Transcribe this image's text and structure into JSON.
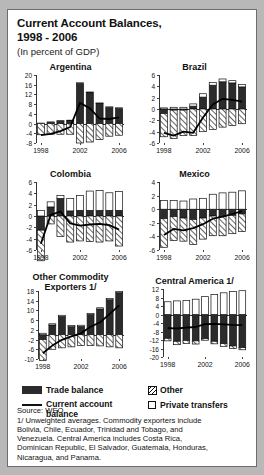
{
  "figure": {
    "title_line1": "Current Account Balances,",
    "title_line2": "1998 - 2006",
    "subtitle": "(In percent of GDP)"
  },
  "legend": {
    "trade_balance": "Trade balance",
    "current_account_line1": "Current account",
    "current_account_line2": "balance",
    "other": "Other",
    "private_transfers": "Private transfers"
  },
  "source": {
    "line1": "Source: WEO.",
    "line2": "1/ Unweighted averages. Commodity exporters include",
    "line3": "Bolivia, Chile, Ecuador, Trinidad and Tobago, and",
    "line4": "Venezuela. Central America includes Costa Rica,",
    "line5": "Dominican Republic, El Salvador, Guatemala, Honduras,",
    "line6": "Nicaragua, and Panama."
  },
  "chart_data": [
    {
      "type": "bar",
      "id": "argentina",
      "title": "Argentina",
      "xlabel": "",
      "ylabel": "",
      "ylim": [
        -8,
        20
      ],
      "yticks": [
        20,
        16,
        12,
        8,
        4,
        0,
        -4,
        -8
      ],
      "categories": [
        "1998",
        "1999",
        "2000",
        "2001",
        "2002",
        "2003",
        "2004",
        "2005",
        "2006"
      ],
      "xticklabels": [
        "1998",
        "",
        "",
        "",
        "2002",
        "",
        "",
        "",
        "2006"
      ],
      "grid": false,
      "legend_position": "figure-bottom",
      "series": [
        {
          "name": "Trade balance",
          "stack": "pos",
          "values": [
            0.0,
            0.5,
            1.0,
            1.2,
            16.5,
            12.7,
            8.2,
            6.6,
            6.2
          ]
        },
        {
          "name": "Other",
          "stack": "neg",
          "values": [
            -4.6,
            -4.4,
            -4.4,
            -4.4,
            -8.0,
            -7.6,
            -6.6,
            -5.2,
            -4.8
          ]
        },
        {
          "name": "Private transfers",
          "stack": "pos-small",
          "values": [
            0.2,
            0.2,
            0.2,
            0.2,
            0.3,
            0.3,
            0.3,
            0.3,
            0.3
          ]
        },
        {
          "name": "Current account balance",
          "type": "line",
          "values": [
            -4.8,
            -4.2,
            -3.1,
            -1.4,
            8.5,
            6.3,
            2.1,
            1.9,
            2.6
          ]
        }
      ]
    },
    {
      "type": "bar",
      "id": "brazil",
      "title": "Brazil",
      "xlabel": "",
      "ylabel": "",
      "ylim": [
        -6,
        6
      ],
      "yticks": [
        6,
        4,
        2,
        0,
        -2,
        -4,
        -6
      ],
      "categories": [
        "1998",
        "1999",
        "2000",
        "2001",
        "2002",
        "2003",
        "2004",
        "2005",
        "2006"
      ],
      "xticklabels": [
        "1998",
        "",
        "",
        "",
        "2002",
        "",
        "",
        "",
        "2006"
      ],
      "grid": false,
      "series": [
        {
          "name": "Trade balance",
          "stack": "pos",
          "values": [
            -0.8,
            -0.2,
            -0.2,
            0.5,
            2.1,
            4.2,
            4.8,
            4.6,
            3.9
          ]
        },
        {
          "name": "Other",
          "stack": "neg",
          "values": [
            -4.1,
            -5.0,
            -4.5,
            -4.7,
            -4.0,
            -3.6,
            -3.2,
            -2.9,
            -2.6
          ]
        },
        {
          "name": "Private transfers",
          "stack": "pos-small",
          "values": [
            0.2,
            0.3,
            0.3,
            0.4,
            0.6,
            0.5,
            0.5,
            0.4,
            0.4
          ]
        },
        {
          "name": "Current account balance",
          "type": "line",
          "values": [
            -4.2,
            -4.7,
            -4.0,
            -4.2,
            -1.5,
            0.8,
            1.8,
            1.6,
            1.3
          ]
        }
      ]
    },
    {
      "type": "bar",
      "id": "colombia",
      "title": "Colombia",
      "xlabel": "",
      "ylabel": "",
      "ylim": [
        -6,
        6
      ],
      "yticks": [
        6,
        4,
        2,
        0,
        -2,
        -4,
        -6
      ],
      "categories": [
        "1998",
        "1999",
        "2000",
        "2001",
        "2002",
        "2003",
        "2004",
        "2005",
        "2006"
      ],
      "xticklabels": [
        "1998",
        "",
        "",
        "",
        "2002",
        "",
        "",
        "",
        "2006"
      ],
      "grid": false,
      "series": [
        {
          "name": "Trade balance",
          "stack": "pos-neg",
          "values": [
            -2.5,
            1.6,
            3.1,
            0.9,
            1.0,
            1.0,
            1.0,
            1.0,
            1.0
          ]
        },
        {
          "name": "Other",
          "stack": "neg",
          "values": [
            -5.4,
            -1.4,
            -3.6,
            -4.6,
            -4.4,
            -4.5,
            -4.6,
            -4.4,
            -5.3
          ]
        },
        {
          "name": "Private transfers",
          "stack": "pos",
          "values": [
            1.0,
            0.9,
            0.5,
            2.2,
            2.6,
            3.4,
            3.5,
            3.1,
            3.3
          ]
        },
        {
          "name": "Current account balance",
          "type": "line",
          "values": [
            -4.9,
            0.2,
            0.8,
            -1.3,
            -1.7,
            -1.5,
            -1.4,
            -1.6,
            -2.4
          ]
        }
      ]
    },
    {
      "type": "bar",
      "id": "mexico",
      "title": "Mexico",
      "xlabel": "",
      "ylabel": "",
      "ylim": [
        -6,
        4
      ],
      "yticks": [
        4,
        2,
        0,
        -2,
        -4,
        -6
      ],
      "categories": [
        "1998",
        "1999",
        "2000",
        "2001",
        "2002",
        "2003",
        "2004",
        "2005",
        "2006"
      ],
      "xticklabels": [
        "1998",
        "",
        "",
        "",
        "2002",
        "",
        "",
        "",
        "2006"
      ],
      "grid": false,
      "series": [
        {
          "name": "Trade balance",
          "stack": "neg",
          "values": [
            -1.4,
            -1.1,
            -1.3,
            -1.5,
            -1.3,
            -1.0,
            -1.1,
            -0.9,
            -0.7
          ]
        },
        {
          "name": "Other",
          "stack": "neg2",
          "values": [
            -4.2,
            -3.5,
            -3.4,
            -3.7,
            -3.1,
            -2.9,
            -2.8,
            -2.7,
            -2.6
          ]
        },
        {
          "name": "Private transfers",
          "stack": "pos",
          "values": [
            1.3,
            1.3,
            1.2,
            1.5,
            1.6,
            2.2,
            2.4,
            2.5,
            2.7
          ]
        },
        {
          "name": "Current account balance",
          "type": "line",
          "values": [
            -3.8,
            -2.9,
            -3.1,
            -2.8,
            -2.2,
            -1.4,
            -1.1,
            -0.7,
            -0.3
          ]
        }
      ]
    },
    {
      "type": "bar",
      "id": "other_commodity_exporters",
      "title_line1": "Other Commodity",
      "title_line2": "Exporters 1/",
      "title": "Other Commodity Exporters 1/",
      "xlabel": "",
      "ylabel": "",
      "ylim": [
        -10,
        18
      ],
      "yticks": [
        18,
        14,
        10,
        6,
        2,
        -2,
        -6,
        -10
      ],
      "categories": [
        "1998",
        "1999",
        "2000",
        "2001",
        "2002",
        "2003",
        "2004",
        "2005",
        "2006"
      ],
      "xticklabels": [
        "1998",
        "",
        "",
        "",
        "2002",
        "",
        "",
        "",
        "2006"
      ],
      "grid": false,
      "series": [
        {
          "name": "Trade balance",
          "stack": "pos",
          "values": [
            -2.0,
            4.0,
            7.5,
            3.3,
            3.4,
            8.3,
            10.6,
            14.4,
            17.3
          ]
        },
        {
          "name": "Other",
          "stack": "neg",
          "values": [
            -8.6,
            -6.0,
            -5.4,
            -5.0,
            -4.4,
            -4.5,
            -4.6,
            -5.0,
            -5.4
          ]
        },
        {
          "name": "Private transfers",
          "stack": "pos-small",
          "values": [
            0.6,
            0.5,
            0.5,
            0.5,
            0.5,
            0.5,
            0.5,
            0.5,
            0.5
          ]
        },
        {
          "name": "Current account balance",
          "type": "line",
          "values": [
            -7.6,
            -4.5,
            -2.1,
            -0.7,
            0.6,
            3.3,
            5.1,
            8.6,
            12.1
          ]
        }
      ]
    },
    {
      "type": "bar",
      "id": "central_america",
      "title": "Central America 1/",
      "xlabel": "",
      "ylabel": "",
      "ylim": [
        -20,
        12
      ],
      "yticks": [
        12,
        8,
        4,
        0,
        -4,
        -8,
        -12,
        -16,
        -20
      ],
      "categories": [
        "1998",
        "1999",
        "2000",
        "2001",
        "2002",
        "2003",
        "2004",
        "2005",
        "2006"
      ],
      "xticklabels": [
        "1998",
        "",
        "",
        "",
        "2002",
        "",
        "",
        "",
        "2006"
      ],
      "grid": false,
      "series": [
        {
          "name": "Trade balance",
          "stack": "neg",
          "values": [
            -11.2,
            -12.6,
            -12.2,
            -12.4,
            -11.3,
            -12.6,
            -13.7,
            -14.8,
            -15.6
          ]
        },
        {
          "name": "Other",
          "stack": "neg2",
          "values": [
            -1.2,
            -1.6,
            -1.5,
            -1.5,
            -0.8,
            -1.2,
            -1.3,
            -1.2,
            -1.0
          ]
        },
        {
          "name": "Private transfers",
          "stack": "pos",
          "values": [
            6.0,
            6.4,
            6.6,
            7.2,
            8.4,
            9.4,
            10.2,
            10.8,
            11.2
          ]
        },
        {
          "name": "Current account balance",
          "type": "line",
          "values": [
            -6.4,
            -6.6,
            -6.2,
            -5.9,
            -4.5,
            -4.4,
            -4.6,
            -4.9,
            -5.0
          ]
        }
      ]
    }
  ]
}
